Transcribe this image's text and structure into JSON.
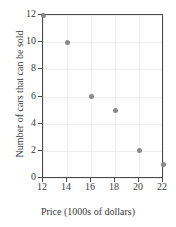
{
  "chart_data": {
    "type": "scatter",
    "title": "",
    "xlabel": "Price (1000s of dollars)",
    "ylabel": "Number of cars that can be sold",
    "xlim": [
      12,
      22
    ],
    "ylim": [
      0,
      12
    ],
    "xticks": [
      12,
      14,
      16,
      18,
      20,
      22
    ],
    "yticks": [
      0,
      2,
      4,
      6,
      8,
      10,
      12
    ],
    "xticklabels": [
      "12",
      "14",
      "16",
      "18",
      "20",
      "22"
    ],
    "yticklabels": [
      "0",
      "2",
      "4",
      "6",
      "8",
      "10",
      "12"
    ],
    "grid": true,
    "legend": false,
    "x": [
      12,
      14,
      16,
      18,
      20,
      22
    ],
    "y": [
      12,
      10,
      6,
      5,
      2,
      1
    ],
    "points": [
      {
        "x": 12,
        "y": 12
      },
      {
        "x": 14,
        "y": 10
      },
      {
        "x": 16,
        "y": 6
      },
      {
        "x": 18,
        "y": 5
      },
      {
        "x": 20,
        "y": 2
      },
      {
        "x": 22,
        "y": 1
      }
    ],
    "marker_color": "#8a8a8a",
    "axis_color": "#4a4a4a",
    "grid_color": "#ededed",
    "background_color": "#ffffff"
  }
}
